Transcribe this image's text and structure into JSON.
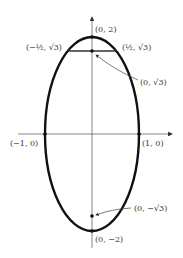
{
  "diagram": {
    "type": "ellipse",
    "equation_hint": "x^2 + y^2/4 = 1",
    "colors": {
      "curve": "#111111",
      "axis": "#555555",
      "text": "#333333",
      "background": "#ffffff"
    },
    "labels": {
      "top_vertex": "(0, 2)",
      "bottom_vertex": "(0, −2)",
      "left_vertex": "(−1, 0)",
      "right_vertex": "(1, 0)",
      "focus_top": "(0, √3)",
      "focus_bottom": "(0, −√3)",
      "chord_left": "(−½, √3)",
      "chord_right": "(½, √3)"
    }
  }
}
